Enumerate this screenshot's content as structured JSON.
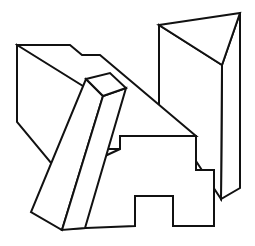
{
  "figure": {
    "background_color": "#ffffff",
    "stroke_color": "#111111",
    "fill_color": "#ffffff",
    "stroke_width": 2,
    "canvas": {
      "width": 255,
      "height": 246
    },
    "projection": "isometric-oblique line drawing",
    "objects": [
      {
        "name": "stepped-block",
        "label": "Stepped rectangular block with T-shaped notch",
        "position": "left and center",
        "faces": [
          {
            "name": "top-face",
            "label": "Top face of stepped block",
            "points": "17,45 70,45 82,55 100,55 196,136 120,136 120,149 99,149"
          },
          {
            "name": "left-face",
            "label": "Left side face of stepped block",
            "points": "17,45 17,122 62,176 62,229 99,149 99,96"
          },
          {
            "name": "front-face",
            "label": "Front face of stepped block with T notch",
            "points": "120,136 196,136 196,170 214,170 214,226 173,226 173,196 135,196 135,226 62,229 62,176 120,149"
          }
        ]
      },
      {
        "name": "diagonal-bar",
        "label": "Long diagonal bar crossing the block",
        "position": "center-left, oriented upper-right to lower-left",
        "faces": [
          {
            "name": "bar-end-face",
            "label": "End cap face of diagonal bar",
            "points": "86,79 110,73 126,88 103,96"
          },
          {
            "name": "bar-left-face",
            "label": "Left long face of diagonal bar",
            "points": "86,79 103,96 62,230 31,212"
          },
          {
            "name": "bar-right-face",
            "label": "Right long face of diagonal bar",
            "points": "103,96 126,88 85,228 62,230"
          }
        ]
      },
      {
        "name": "triangular-prism",
        "label": "Upright triangular prism",
        "position": "right side",
        "faces": [
          {
            "name": "prism-top-face",
            "label": "Triangular top face of prism",
            "points": "159,25 240,13 222,65"
          },
          {
            "name": "prism-left-face",
            "label": "Left vertical face of prism",
            "points": "159,25 222,65 221,199 159,105"
          },
          {
            "name": "prism-right-face",
            "label": "Right vertical face of prism",
            "points": "240,13 240,188 221,199 222,65"
          }
        ]
      }
    ]
  }
}
